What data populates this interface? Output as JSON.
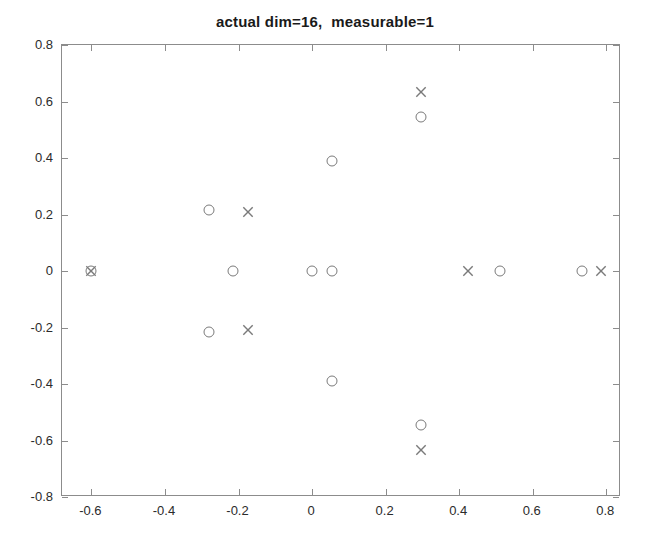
{
  "chart_data": {
    "type": "scatter",
    "title": "actual dim=16,  measurable=1",
    "xlabel": "",
    "ylabel": "",
    "xlim": [
      -0.68,
      0.84
    ],
    "ylim": [
      -0.8,
      0.8
    ],
    "xticks": [
      -0.6,
      -0.4,
      -0.2,
      0,
      0.2,
      0.4,
      0.6,
      0.8
    ],
    "xticklabels": [
      "-0.6",
      "-0.4",
      "-0.2",
      "0",
      "0.2",
      "0.4",
      "0.6",
      "0.8"
    ],
    "yticks": [
      -0.8,
      -0.6,
      -0.4,
      -0.2,
      0,
      0.2,
      0.4,
      0.6,
      0.8
    ],
    "yticklabels": [
      "-0.8",
      "-0.6",
      "-0.4",
      "-0.2",
      "0",
      "0.2",
      "0.4",
      "0.6",
      "0.8"
    ],
    "grid": false,
    "legend": null,
    "marker_color": "#7a7a7a",
    "axis_color": "#8c8c8c",
    "series": [
      {
        "name": "circle",
        "marker": "o",
        "points": [
          {
            "x": -0.6,
            "y": 0.0
          },
          {
            "x": -0.28,
            "y": 0.215
          },
          {
            "x": -0.28,
            "y": -0.215
          },
          {
            "x": -0.215,
            "y": 0.0
          },
          {
            "x": 0.0,
            "y": 0.0
          },
          {
            "x": 0.055,
            "y": 0.0
          },
          {
            "x": 0.055,
            "y": 0.39
          },
          {
            "x": 0.055,
            "y": -0.39
          },
          {
            "x": 0.295,
            "y": 0.545
          },
          {
            "x": 0.295,
            "y": -0.545
          },
          {
            "x": 0.51,
            "y": 0.0
          },
          {
            "x": 0.735,
            "y": 0.0
          }
        ]
      },
      {
        "name": "cross",
        "marker": "x",
        "points": [
          {
            "x": -0.6,
            "y": 0.0
          },
          {
            "x": -0.175,
            "y": 0.21
          },
          {
            "x": -0.175,
            "y": -0.21
          },
          {
            "x": 0.425,
            "y": 0.0
          },
          {
            "x": 0.295,
            "y": 0.635
          },
          {
            "x": 0.295,
            "y": -0.635
          },
          {
            "x": 0.785,
            "y": 0.0
          }
        ]
      }
    ]
  }
}
